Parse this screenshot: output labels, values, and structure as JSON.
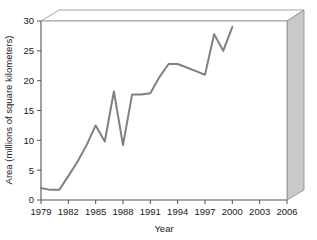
{
  "chart_data": {
    "type": "line",
    "title": "",
    "xlabel": "Year",
    "ylabel": "Area (millions of square kilometers)",
    "xlim": [
      1979,
      2006
    ],
    "ylim": [
      0,
      30
    ],
    "grid": false,
    "legend": false,
    "xticks": [
      "1979",
      "1982",
      "1985",
      "1988",
      "1991",
      "1994",
      "1997",
      "2000",
      "2003",
      "2006"
    ],
    "xtick_values": [
      1979,
      1982,
      1985,
      1988,
      1991,
      1994,
      1997,
      2000,
      2003,
      2006
    ],
    "yticks": [
      "0",
      "5",
      "10",
      "15",
      "20",
      "25",
      "30"
    ],
    "ytick_values": [
      0,
      5,
      10,
      15,
      20,
      25,
      30
    ],
    "series": [
      {
        "name": "Area",
        "x": [
          1979,
          1980,
          1981,
          1982,
          1983,
          1984,
          1985,
          1986,
          1987,
          1988,
          1989,
          1990,
          1991,
          1992,
          1993,
          1994,
          1995,
          1996,
          1997,
          1998,
          1999,
          2000
        ],
        "values": [
          2.0,
          1.7,
          1.7,
          4.0,
          6.4,
          9.2,
          12.5,
          9.8,
          18.2,
          9.2,
          17.7,
          17.7,
          17.9,
          20.6,
          22.8,
          22.8,
          22.2,
          21.6,
          21.0,
          27.8,
          25.0,
          29.0
        ],
        "color": "#808080",
        "line_width": 2
      }
    ]
  },
  "style": {
    "line_color": "#808080",
    "axis_color": "#555555",
    "panel_face": "#ffffff",
    "panel_side": "#c8c8c8",
    "panel_top": "#ffffff",
    "text_color": "#1a1a1a"
  }
}
